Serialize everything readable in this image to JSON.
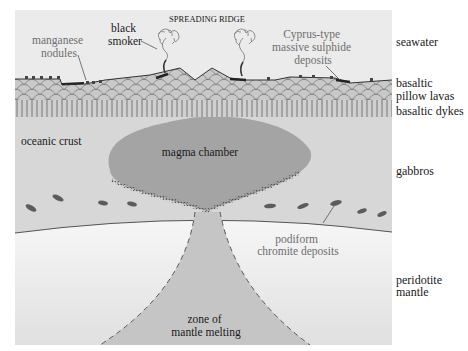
{
  "title": "SPREADING RIDGE",
  "colors": {
    "panel_bg": "#e9e9e9",
    "seawater": "#ececec",
    "pillow": "#c6c6c6",
    "dykes_bg": "#cfcfcf",
    "gabbro": "#d6d6d6",
    "magma": "#a3a3a3",
    "mantle_top": "#f3f3f3",
    "mantle_bottom": "#e2e2e2",
    "melt_zone": "#c4c4c4",
    "deposit": "#5a5a5a",
    "grey_text": "#6e6e6e"
  },
  "labels": {
    "spreading_ridge": "SPREADING RIDGE",
    "black_smoker": [
      "black",
      "smoker"
    ],
    "manganese_nodules": [
      "manganese",
      "nodules"
    ],
    "cyprus_deposits": [
      "Cyprus-type",
      "massive sulphide",
      "deposits"
    ],
    "oceanic_crust": "oceanic crust",
    "magma_chamber": "magma chamber",
    "podiform_chromite": [
      "podiform",
      "chromite deposits"
    ],
    "zone_of_melting": [
      "zone of",
      "mantle melting"
    ]
  },
  "side_labels": {
    "seawater": [
      "seawater"
    ],
    "pillow_lavas": [
      "basaltic",
      "pillow lavas"
    ],
    "dykes": [
      "basaltic dykes"
    ],
    "gabbros": [
      "gabbros"
    ],
    "mantle": [
      "peridotite",
      "mantle"
    ]
  }
}
